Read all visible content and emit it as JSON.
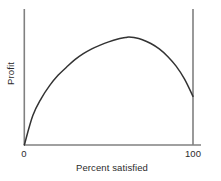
{
  "chart_data": {
    "type": "line",
    "title": "",
    "subtitle": "",
    "xlabel": "Percent satisfied",
    "ylabel": "Profit",
    "xlim": [
      0,
      100
    ],
    "ylim": [
      0,
      1
    ],
    "grid": false,
    "legend": null,
    "xticks": [
      "0",
      "100"
    ],
    "xtick_values": [
      0,
      100
    ],
    "yticks": [],
    "annotations": [],
    "series": [
      {
        "name": "Profit vs percent satisfied",
        "color": "#333333",
        "x": [
          0,
          5,
          10,
          15,
          20,
          25,
          30,
          35,
          40,
          45,
          50,
          55,
          60,
          62,
          65,
          70,
          75,
          80,
          85,
          90,
          95,
          100
        ],
        "y": [
          0.0,
          0.27,
          0.43,
          0.55,
          0.645,
          0.72,
          0.79,
          0.845,
          0.89,
          0.925,
          0.955,
          0.98,
          0.995,
          1.0,
          0.995,
          0.975,
          0.94,
          0.89,
          0.82,
          0.73,
          0.61,
          0.45
        ]
      }
    ]
  },
  "axes": {
    "y_axis_label": "Profit",
    "x_axis_label": "Percent satisfied",
    "tick_left": "0",
    "tick_right": "100"
  },
  "colors": {
    "axis": "#808080",
    "curve": "#333333",
    "background": "#ffffff",
    "text": "#2b2b2b"
  }
}
